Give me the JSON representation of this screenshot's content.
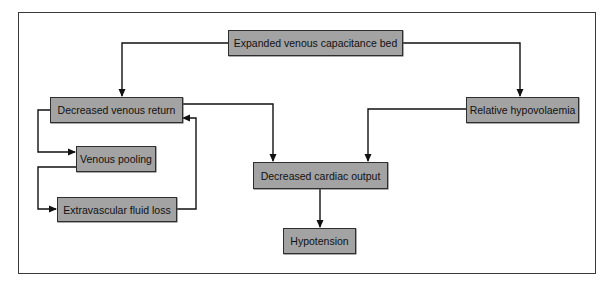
{
  "diagram": {
    "type": "flowchart",
    "colors": {
      "node_fill": "#a3a3a3",
      "node_border": "#2e2e2e",
      "line": "#111111",
      "background": "#ffffff"
    },
    "nodes": {
      "expanded": {
        "label": "Expanded venous capacitance bed"
      },
      "venous_return": {
        "label": "Decreased venous return"
      },
      "hypovolaemia": {
        "label": "Relative hypovolaemia"
      },
      "pooling": {
        "label": "Venous pooling"
      },
      "fluid_loss": {
        "label": "Extravascular fluid loss"
      },
      "cardiac_output": {
        "label": "Decreased cardiac output"
      },
      "hypotension": {
        "label": "Hypotension"
      }
    },
    "edges": [
      {
        "from": "Expanded venous capacitance bed",
        "to": "Decreased venous return"
      },
      {
        "from": "Expanded venous capacitance bed",
        "to": "Relative hypovolaemia"
      },
      {
        "from": "Decreased venous return",
        "to": "Decreased cardiac output"
      },
      {
        "from": "Relative hypovolaemia",
        "to": "Decreased cardiac output"
      },
      {
        "from": "Decreased venous return",
        "to": "Venous pooling"
      },
      {
        "from": "Venous pooling",
        "to": "Extravascular fluid loss"
      },
      {
        "from": "Extravascular fluid loss",
        "to": "Decreased venous return"
      },
      {
        "from": "Decreased cardiac output",
        "to": "Hypotension"
      }
    ]
  }
}
